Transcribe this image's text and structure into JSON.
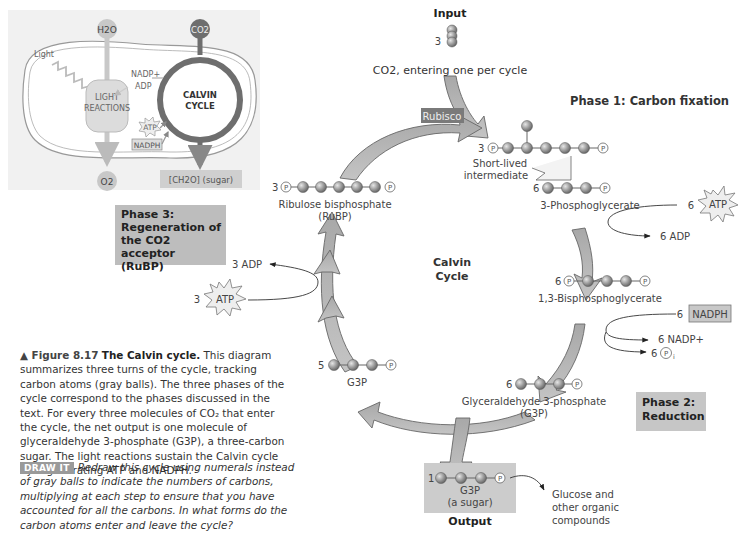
{
  "inset": {
    "h2o": "H2O",
    "co2": "CO2",
    "light": "Light",
    "nadp_plus": "NADP+",
    "adp": "ADP",
    "light_reactions_line1": "LIGHT",
    "light_reactions_line2": "REACTIONS",
    "calvin_line1": "CALVIN",
    "calvin_line2": "CYCLE",
    "atp": "ATP",
    "nadph": "NADPH",
    "o2": "O2",
    "sugar": "[CH2O] (sugar)"
  },
  "input": {
    "title": "Input",
    "count": "3",
    "label": "CO2, entering one per cycle"
  },
  "phase1": {
    "label": "Phase 1: Carbon fixation"
  },
  "rubisco": {
    "label": "Rubisco"
  },
  "intermediate": {
    "count": "3",
    "label_line1": "Short-lived",
    "label_line2": "intermediate"
  },
  "pga": {
    "count": "6",
    "label": "3-Phosphoglycerate"
  },
  "atp_in_phase2": {
    "count": "6",
    "label": "ATP"
  },
  "adp_out_phase2": {
    "label": "6 ADP"
  },
  "bpg": {
    "count": "6",
    "label": "1,3-Bisphosphoglycerate"
  },
  "nadph_in": {
    "count": "6",
    "label": "NADPH"
  },
  "nadp_out": {
    "label": "6 NADP+"
  },
  "pi_out": {
    "count": "6",
    "label": "Pi"
  },
  "g3p6": {
    "count": "6",
    "label_line1": "Glyceraldehyde 3-phosphate",
    "label_line2": "(G3P)"
  },
  "phase2": {
    "line1": "Phase 2:",
    "line2": "Reduction"
  },
  "output": {
    "count": "1",
    "label_line1": "G3P",
    "label_line2": "(a sugar)",
    "title": "Output",
    "destination_line1": "Glucose and",
    "destination_line2": "other organic",
    "destination_line3": "compounds"
  },
  "g3p5": {
    "count": "5",
    "label": "G3P"
  },
  "cycle_center": {
    "line1": "Calvin",
    "line2": "Cycle"
  },
  "phase3": {
    "line1": "Phase 3:",
    "line2": "Regeneration of",
    "line3": "the CO2 acceptor",
    "line4": "(RuBP)"
  },
  "atp_in_phase3": {
    "count": "3",
    "label": "ATP"
  },
  "adp_out_phase3": {
    "label": "3 ADP"
  },
  "rubp": {
    "count": "3",
    "label_line1": "Ribulose bisphosphate",
    "label_line2": "(RuBP)"
  },
  "caption": {
    "figure_label": "▲ Figure 8.17",
    "title": "The Calvin cycle.",
    "body": "This diagram summarizes three turns of the cycle, tracking carbon atoms (gray balls). The three phases of the cycle correspond to the phases discussed in the text. For every three molecules of CO₂ that enter the cycle, the net output is one molecule of glyceraldehyde 3-phosphate (G3P), a three-carbon sugar. The light reactions sustain the Calvin cycle by regenerating ATP and NADPH."
  },
  "draw_it": {
    "tag": "DRAW IT",
    "text": "Redraw this cycle using numerals instead of gray balls to indicate the numbers of carbons, multiplying at each step to ensure that you have accounted for all the carbons. In what forms do the carbon atoms enter and leave the cycle?"
  },
  "colors": {
    "arrow_fill": "#b0b0b0",
    "carbon_ball": "#8a8a8a",
    "phase_box": "#bdbdbd",
    "rubisco_box": "#7a7a7a"
  }
}
